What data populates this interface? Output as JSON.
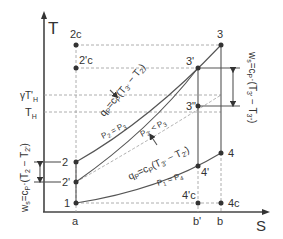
{
  "diagram": {
    "axes": {
      "y_label": "T",
      "x_label": "S",
      "y_ticks": [
        "γT'H",
        "TH"
      ],
      "x_ticks": [
        "a",
        "b'",
        "b"
      ]
    },
    "points": {
      "p1": "1",
      "p2": "2",
      "p2p": "2'",
      "p2c": "2c",
      "p2pc": "2'c",
      "p3": "3",
      "p3p": "3'",
      "p3pp": "3\"",
      "p4": "4",
      "p4p": "4'",
      "p4pc": "4'c",
      "p4c": "4c"
    },
    "labels": {
      "heat_in": "qP=cP·(T3' − T2)",
      "heat_in_q": "q",
      "heat_in_sub": "P",
      "heat_in_eq": "=c",
      "heat_in_rest": "(T",
      "heat_in_t3": "3'",
      "heat_in_minus": " − T",
      "heat_in_t2": "2",
      "heat_in_close": ")",
      "heat_out_q": "q",
      "heat_out_eq": "=c",
      "heat_out_rest": "(T",
      "heat_out_t3": "3'",
      "heat_out_minus": " − T",
      "heat_out_t2": "2'",
      "heat_out_close": ")",
      "isobar_high": "P2 = P3",
      "isobar_high_a": "P",
      "isobar_high_b": "2",
      "isobar_high_c": " = P",
      "isobar_high_d": "3",
      "isobar_mid_a": "P",
      "isobar_mid_b": "2'",
      "isobar_mid_c": " < P",
      "isobar_mid_d": "3",
      "isobar_low_a": "P",
      "isobar_low_b": "1",
      "isobar_low_c": " = P",
      "isobar_low_d": "4",
      "work_comp": "ws=cP·(T2 − T2')",
      "work_comp_w": "w",
      "work_comp_s": "s",
      "work_comp_eq": "=c",
      "work_comp_p": "P",
      "work_comp_rest": "·(T",
      "work_comp_t2": "2",
      "work_comp_minus": " − T",
      "work_comp_t2p": "2'",
      "work_comp_close": ")",
      "work_turb_w": "w",
      "work_turb_s": "s",
      "work_turb_eq": "=c",
      "work_turb_p": "P",
      "work_turb_rest": "·(T",
      "work_turb_t3": "3'",
      "work_turb_minus": " − T",
      "work_turb_t3pp": "3\"",
      "work_turb_close": ")",
      "ytick1_main": "γT'",
      "ytick1_sub": "H",
      "ytick2_main": "T",
      "ytick2_sub": "H"
    },
    "colors": {
      "line": "#444444",
      "dashed": "#999999",
      "point": "#333333"
    }
  }
}
